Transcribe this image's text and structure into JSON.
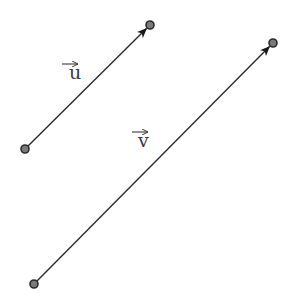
{
  "diagram": {
    "title": "",
    "background": "#ffffff",
    "line_color": "#2a2a2a",
    "point_fill": "#7a7a7a",
    "point_stroke": "#2a2a2a",
    "vectors": [
      {
        "name": "u",
        "label": "u",
        "start": [
          25,
          149
        ],
        "end": [
          150,
          25
        ],
        "label_pos": [
          69,
          79
        ],
        "arrow_pos": [
          62,
          64
        ]
      },
      {
        "name": "v",
        "label": "v",
        "start": [
          34,
          284
        ],
        "end": [
          273,
          43
        ],
        "label_pos": [
          138,
          147
        ],
        "arrow_pos": [
          132,
          132
        ]
      }
    ]
  }
}
